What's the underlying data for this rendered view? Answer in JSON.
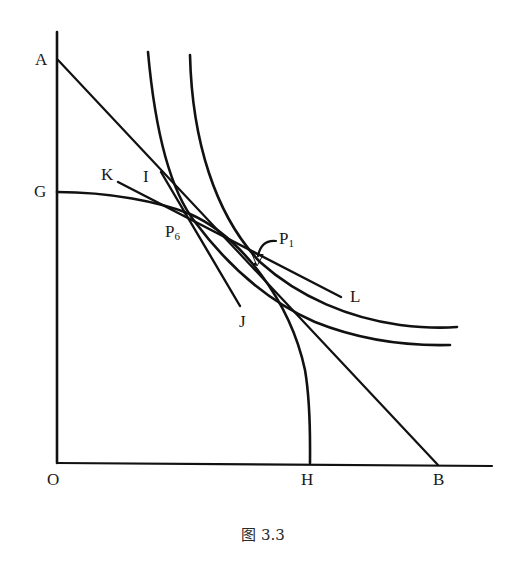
{
  "figure": {
    "caption": "图 3.3",
    "stroke_color": "#111111",
    "background": "#ffffff"
  },
  "labels": {
    "A": "A",
    "G": "G",
    "O": "O",
    "H": "H",
    "B": "B",
    "K": "K",
    "I": "I",
    "J": "J",
    "L": "L",
    "P6_base": "P",
    "P6_sub": "6",
    "P1_base": "P",
    "P1_sub": "1"
  },
  "elements": {
    "axes": [
      "vertical axis through A, G, O",
      "horizontal axis through O, H, B"
    ],
    "lines": [
      {
        "name": "AB",
        "from": "A",
        "to": "B",
        "type": "straight budget/price line"
      },
      {
        "name": "KL",
        "from": "K",
        "to": "L",
        "type": "straight tangent line"
      },
      {
        "name": "IJ",
        "from": "I",
        "to": "J",
        "type": "straight tangent line"
      }
    ],
    "curves": [
      {
        "name": "GH",
        "type": "production possibility frontier (concave)"
      },
      {
        "name": "indifference-curve-inner",
        "type": "convex curve through P6"
      },
      {
        "name": "indifference-curve-outer",
        "type": "convex curve through P1"
      }
    ],
    "points": [
      "P6",
      "P1"
    ]
  }
}
